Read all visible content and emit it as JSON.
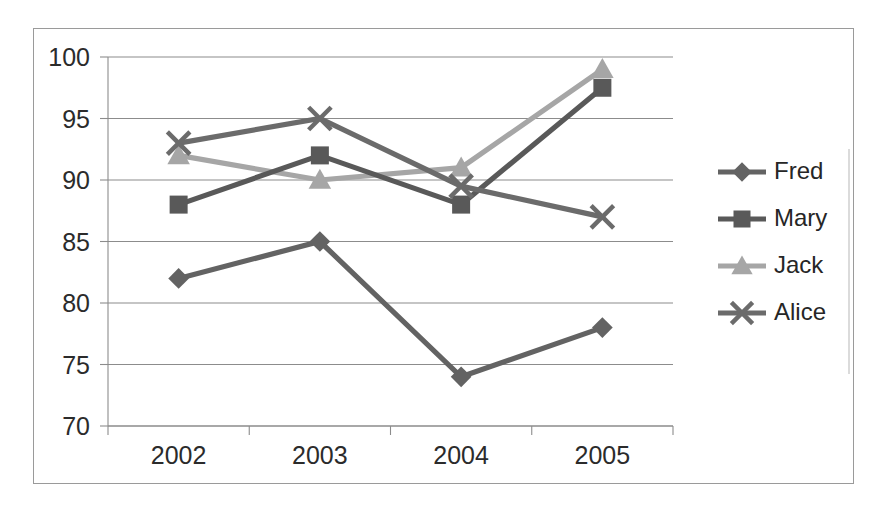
{
  "chart_data": {
    "type": "line",
    "title": "",
    "subtitle": "",
    "xlabel": "",
    "ylabel": "",
    "categories": [
      "2002",
      "2003",
      "2004",
      "2005"
    ],
    "ylim": [
      70,
      100
    ],
    "yticks": [
      70,
      75,
      80,
      85,
      90,
      95,
      100
    ],
    "ytick_labels": [
      "70",
      "75",
      "80",
      "85",
      "90",
      "95",
      "100"
    ],
    "grid": true,
    "legend_position": "right",
    "series": [
      {
        "name": "Fred",
        "marker": "diamond",
        "color": "#636363",
        "values": [
          82,
          85,
          74,
          78
        ]
      },
      {
        "name": "Mary",
        "marker": "square",
        "color": "#595959",
        "values": [
          88,
          92,
          88,
          97.5
        ]
      },
      {
        "name": "Jack",
        "marker": "triangle",
        "color": "#a6a6a6",
        "values": [
          92,
          90,
          91,
          99
        ]
      },
      {
        "name": "Alice",
        "marker": "cross",
        "color": "#6b6b6b",
        "values": [
          93,
          95,
          89.5,
          87
        ]
      }
    ]
  },
  "legend": {
    "items": [
      {
        "label": "Fred"
      },
      {
        "label": "Mary"
      },
      {
        "label": "Jack"
      },
      {
        "label": "Alice"
      }
    ]
  },
  "colors": {
    "gridline": "#8c8c8c",
    "frame": "#9a9a9a",
    "axis_text": "#2b2b2b",
    "legend_text": "#262626",
    "background": "#ffffff"
  }
}
